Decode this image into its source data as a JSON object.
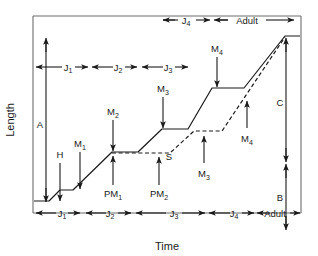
{
  "diagram": {
    "type": "line-diagram",
    "axes": {
      "y_label": "Length",
      "x_label": "Time",
      "frame_color": "#6d6d6d",
      "curve_color": "#1a1a1a"
    },
    "top_brackets": [
      {
        "label": "J",
        "sub": "4"
      },
      {
        "label": "Adult",
        "sub": ""
      }
    ],
    "upper_brackets": [
      {
        "label": "J",
        "sub": "1"
      },
      {
        "label": "J",
        "sub": "2"
      },
      {
        "label": "J",
        "sub": "3"
      }
    ],
    "bottom_brackets": [
      {
        "label": "J",
        "sub": "1"
      },
      {
        "label": "J",
        "sub": "2"
      },
      {
        "label": "J",
        "sub": "3"
      },
      {
        "label": "J",
        "sub": "4"
      },
      {
        "label": "Adult",
        "sub": ""
      }
    ],
    "vertical_measures": [
      {
        "name": "A",
        "label": "A",
        "style": "double-arrow"
      },
      {
        "name": "C",
        "label": "C",
        "style": "double-arrow"
      },
      {
        "name": "B",
        "label": "B",
        "style": "double-arrow"
      }
    ],
    "markers": [
      {
        "name": "H",
        "label": "H",
        "sub": "",
        "direction": "down"
      },
      {
        "name": "M1",
        "label": "M",
        "sub": "1",
        "direction": "down"
      },
      {
        "name": "M2",
        "label": "M",
        "sub": "2",
        "direction": "down"
      },
      {
        "name": "M3",
        "label": "M",
        "sub": "3",
        "direction": "down"
      },
      {
        "name": "M4",
        "label": "M",
        "sub": "4",
        "direction": "down"
      },
      {
        "name": "PM1",
        "label": "PM",
        "sub": "1",
        "direction": "up"
      },
      {
        "name": "PM2",
        "label": "PM",
        "sub": "2",
        "direction": "up"
      },
      {
        "name": "S",
        "label": "S",
        "sub": "",
        "direction": "up"
      },
      {
        "name": "M3b",
        "label": "M",
        "sub": "3",
        "direction": "up"
      },
      {
        "name": "M4b",
        "label": "M",
        "sub": "4",
        "direction": "up"
      }
    ],
    "curves": [
      {
        "name": "solid-growth-curve",
        "style": "solid"
      },
      {
        "name": "dashed-growth-curve",
        "style": "dashed"
      }
    ]
  }
}
